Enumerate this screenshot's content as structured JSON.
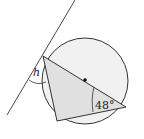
{
  "diagram": {
    "type": "circle-geometry",
    "labels": {
      "angle_h": "h",
      "angle_48": "48°"
    },
    "colors": {
      "circle_fill": "#f0f0f0",
      "triangle_fill": "#e2e2e2",
      "stroke": "#333333"
    }
  }
}
